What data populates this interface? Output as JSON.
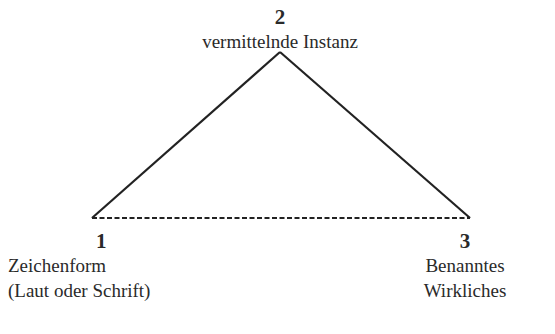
{
  "diagram": {
    "type": "semiotic-triangle",
    "nodes": [
      {
        "id": "1",
        "number": "1",
        "lines": [
          "Zeichenform",
          "(Laut oder Schrift)"
        ],
        "position": "bottom-left"
      },
      {
        "id": "2",
        "number": "2",
        "lines": [
          "vermittelnde Instanz"
        ],
        "position": "top"
      },
      {
        "id": "3",
        "number": "3",
        "lines": [
          "Benanntes",
          "Wirkliches"
        ],
        "position": "bottom-right"
      }
    ],
    "edges": [
      {
        "from": "1",
        "to": "2",
        "style": "solid"
      },
      {
        "from": "2",
        "to": "3",
        "style": "solid"
      },
      {
        "from": "1",
        "to": "3",
        "style": "dashed"
      }
    ],
    "colors": {
      "line": "#222222",
      "text": "#2a2a2a",
      "background": "#ffffff"
    }
  }
}
